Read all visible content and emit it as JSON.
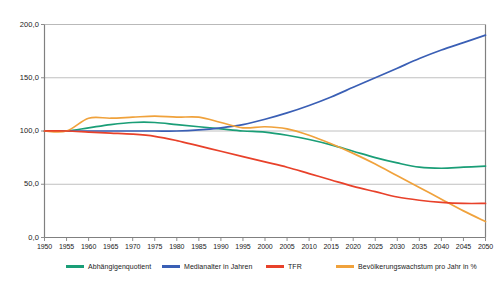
{
  "chart_data": {
    "type": "line",
    "title": "",
    "subtitle": "",
    "xlabel": "",
    "ylabel": "",
    "xlim": [
      1950,
      2050
    ],
    "ylim": [
      0,
      200
    ],
    "grid": "horizontal",
    "legend_position": "bottom",
    "x": [
      1950,
      1955,
      1960,
      1965,
      1970,
      1975,
      1980,
      1985,
      1990,
      1995,
      2000,
      2005,
      2010,
      2015,
      2020,
      2025,
      2030,
      2035,
      2040,
      2045,
      2050
    ],
    "xtick_labels": [
      "1950",
      "1955",
      "1960",
      "1965",
      "1970",
      "1975",
      "1980",
      "1985",
      "1990",
      "1995",
      "2000",
      "2005",
      "2010",
      "2015",
      "2020",
      "2025",
      "2030",
      "2035",
      "2040",
      "2045",
      "2050"
    ],
    "ytick_labels": [
      "0,0",
      "50,0",
      "100,0",
      "150,0",
      "200,0"
    ],
    "ytick_values": [
      0,
      50,
      100,
      150,
      200
    ],
    "series": [
      {
        "name": "Abhängigenquotient",
        "color": "#1a9e77",
        "values": [
          100,
          100,
          103,
          106,
          108,
          108,
          106,
          104,
          102,
          100,
          99,
          96,
          92,
          87,
          81,
          75,
          70,
          66,
          65,
          66,
          67
        ]
      },
      {
        "name": "Medianalter in Jahren",
        "color": "#3a5fb5",
        "values": [
          100,
          100,
          100,
          100,
          100,
          100,
          100,
          101,
          103,
          106,
          111,
          117,
          124,
          132,
          141,
          150,
          159,
          168,
          176,
          183,
          190
        ]
      },
      {
        "name": "TFR",
        "color": "#e8412a",
        "values": [
          100,
          100,
          99,
          98,
          97,
          95,
          91,
          86,
          81,
          76,
          71,
          66,
          60,
          54,
          48,
          43,
          38,
          35,
          33,
          32,
          32
        ]
      },
      {
        "name": "Bevölkerungswachstum pro Jahr in %",
        "color": "#f0a23c",
        "values": [
          100,
          100,
          112,
          112,
          113,
          114,
          113,
          113,
          108,
          103,
          104,
          102,
          96,
          88,
          79,
          69,
          58,
          47,
          36,
          25,
          15
        ]
      }
    ]
  }
}
